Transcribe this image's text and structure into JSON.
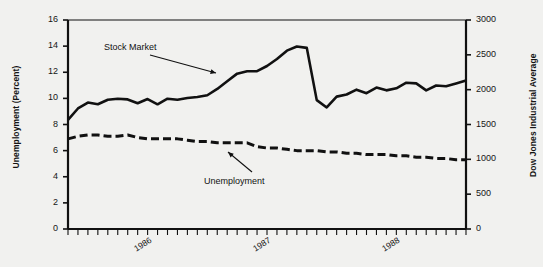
{
  "chart_data": {
    "type": "line",
    "title": "",
    "xlabel": "",
    "ylabel": "Unemployment (Percent)",
    "ylabel_right": "Dow Jones Industrial Average",
    "grid": false,
    "legend_position": "inline-annotations",
    "x_axis": {
      "tick_labels": [
        "1986",
        "1987",
        "1988"
      ],
      "tick_label_positions_months": [
        7,
        19,
        32
      ],
      "minor_ticks": "monthly",
      "n_points": 41
    },
    "y_axis_left": {
      "label": "Unemployment (Percent)",
      "ticks": [
        0,
        2,
        4,
        6,
        8,
        10,
        12,
        14,
        16
      ],
      "ylim": [
        0,
        16
      ]
    },
    "y_axis_right": {
      "label": "Dow Jones Industrial Average",
      "ticks": [
        0,
        500,
        1000,
        1500,
        2000,
        2500,
        3000
      ],
      "ylim": [
        0,
        3000
      ]
    },
    "series": [
      {
        "name": "Stock Market",
        "axis": "right",
        "style": "solid",
        "color": "#111111",
        "annotation": "Stock Market",
        "values": [
          1565,
          1730,
          1815,
          1790,
          1855,
          1870,
          1860,
          1805,
          1865,
          1790,
          1870,
          1855,
          1880,
          1895,
          1920,
          2010,
          2120,
          2230,
          2265,
          2265,
          2340,
          2440,
          2560,
          2620,
          2600,
          1850,
          1745,
          1900,
          1930,
          2000,
          1950,
          2030,
          1990,
          2020,
          2100,
          2090,
          1990,
          2060,
          2050,
          2090,
          2130
        ]
      },
      {
        "name": "Unemployment",
        "axis": "left",
        "style": "dashed",
        "color": "#111111",
        "annotation": "Unemployment",
        "values": [
          6.9,
          7.1,
          7.2,
          7.2,
          7.1,
          7.1,
          7.2,
          7.0,
          6.9,
          6.9,
          6.9,
          6.9,
          6.8,
          6.7,
          6.7,
          6.6,
          6.6,
          6.6,
          6.6,
          6.3,
          6.2,
          6.2,
          6.1,
          6.0,
          6.0,
          6.0,
          5.9,
          5.9,
          5.8,
          5.8,
          5.7,
          5.7,
          5.7,
          5.6,
          5.6,
          5.5,
          5.5,
          5.4,
          5.4,
          5.3,
          5.3
        ]
      }
    ],
    "annotations": [
      {
        "text": "Stock Market",
        "series": "Stock Market"
      },
      {
        "text": "Unemployment",
        "series": "Unemployment"
      }
    ]
  },
  "plot_geometry": {
    "left_px": 68,
    "right_px": 466,
    "top_px": 20,
    "bottom_px": 229
  }
}
